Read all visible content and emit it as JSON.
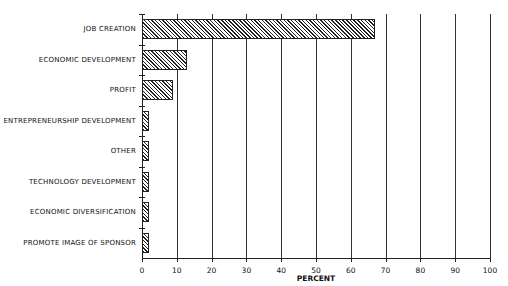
{
  "chart_data": {
    "type": "bar",
    "orientation": "horizontal",
    "title": "",
    "xlabel": "PERCENT",
    "ylabel": "",
    "xlim": [
      0,
      100
    ],
    "grid": true,
    "legend": null,
    "categories": [
      "JOB CREATION",
      "ECONOMIC DEVELOPMENT",
      "PROFIT",
      "ENTREPRENEURSHIP DEVELOPMENT",
      "OTHER",
      "TECHNOLOGY DEVELOPMENT",
      "ECONOMIC DIVERSIFICATION",
      "PROMOTE IMAGE OF SPONSOR"
    ],
    "values": [
      67,
      13,
      9,
      2,
      2,
      2,
      2,
      2
    ],
    "x_ticks": [
      "0",
      "10",
      "20",
      "30",
      "40",
      "50",
      "60",
      "70",
      "80",
      "90",
      "100"
    ]
  }
}
